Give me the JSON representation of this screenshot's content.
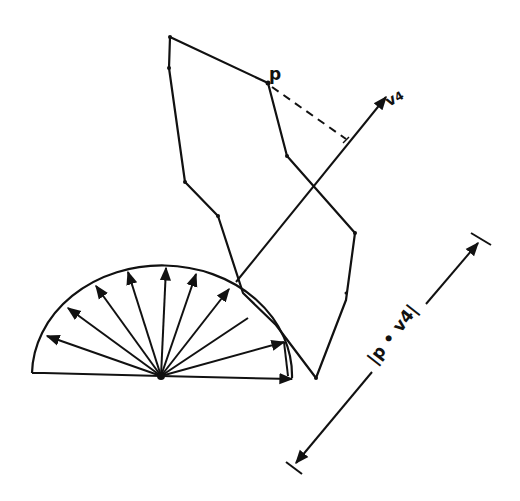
{
  "diagram": {
    "labels": {
      "point": "p",
      "vector": "v4",
      "vector_base": "v",
      "vector_sub": "4",
      "dimension": "|p • v4|"
    },
    "colors": {
      "ink": "#111111",
      "background": "#ffffff"
    },
    "polygon_points": [
      [
        170,
        37
      ],
      [
        268,
        83
      ],
      [
        287,
        156
      ],
      [
        355,
        233
      ],
      [
        346,
        300
      ],
      [
        316,
        378
      ],
      [
        276,
        325
      ],
      [
        243,
        293
      ],
      [
        218,
        216
      ],
      [
        185,
        182
      ],
      [
        169,
        68
      ]
    ],
    "semicircle": {
      "center": [
        161,
        376
      ],
      "radius": 130,
      "arrow_count": 12
    },
    "projection_vector": {
      "from": [
        236,
        282
      ],
      "to": [
        386,
        95
      ]
    },
    "dimension_line": {
      "from": [
        296,
        466
      ],
      "to": [
        481,
        245
      ]
    }
  }
}
